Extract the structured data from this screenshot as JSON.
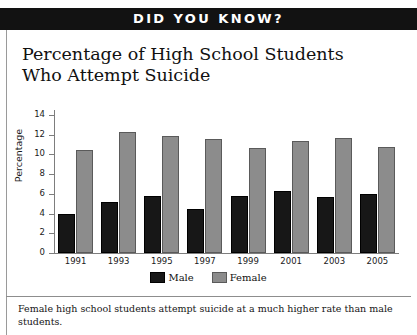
{
  "banner": {
    "label": "DID YOU KNOW?"
  },
  "title": "Percentage of High School Students Who Attempt Suicide",
  "caption": "Female high school students attempt suicide at a much higher rate than male students.",
  "legend": {
    "male": "Male",
    "female": "Female"
  },
  "colors": {
    "banner_background": "#121212",
    "banner_text": "#ffffff",
    "male_bar": "#171717",
    "female_bar": "#8c8c8c",
    "axis": "#7d7d7d",
    "page_background": "#ffffff"
  },
  "chart_data": {
    "type": "bar",
    "title": "Percentage of High School Students Who Attempt Suicide",
    "xlabel": "",
    "ylabel": "Percentage",
    "categories": [
      "1991",
      "1993",
      "1995",
      "1997",
      "1999",
      "2001",
      "2003",
      "2005"
    ],
    "series": [
      {
        "name": "Male",
        "values": [
          4.0,
          5.2,
          5.8,
          4.5,
          5.8,
          6.3,
          5.7,
          6.0
        ]
      },
      {
        "name": "Female",
        "values": [
          10.5,
          12.3,
          11.9,
          11.6,
          10.7,
          11.4,
          11.7,
          10.8
        ]
      }
    ],
    "ylim": [
      0,
      14
    ],
    "yticks": [
      0,
      2,
      4,
      6,
      8,
      10,
      12,
      14
    ],
    "grid": false,
    "legend_position": "bottom"
  }
}
